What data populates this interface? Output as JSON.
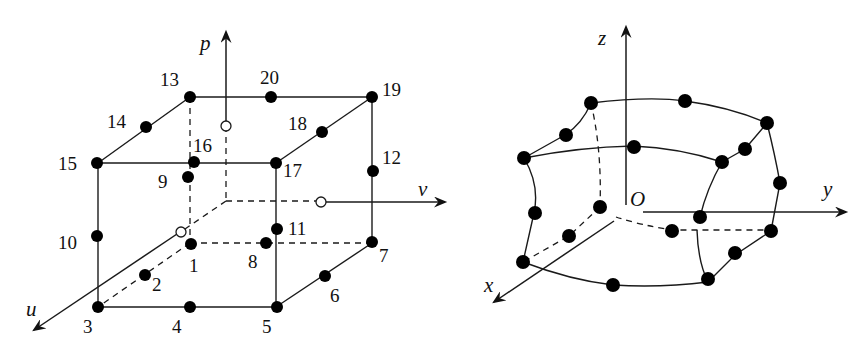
{
  "figure": {
    "left_panel": {
      "title": "20-node hexahedral element in natural coordinates",
      "axes": {
        "u": "u",
        "v": "v",
        "p": "p"
      },
      "node_labels": [
        "1",
        "2",
        "3",
        "4",
        "5",
        "6",
        "7",
        "8",
        "9",
        "10",
        "11",
        "12",
        "13",
        "14",
        "15",
        "16",
        "17",
        "18",
        "19",
        "20"
      ],
      "node_color": "#000000",
      "axis_intersection_markers": "hollow circles on u, v, p axes at element faces"
    },
    "right_panel": {
      "title": "Curved 20-node element in global coordinates",
      "axes": {
        "x": "x",
        "y": "y",
        "z": "z"
      },
      "origin_label": "O",
      "node_count": 20,
      "node_color": "#000000"
    }
  }
}
